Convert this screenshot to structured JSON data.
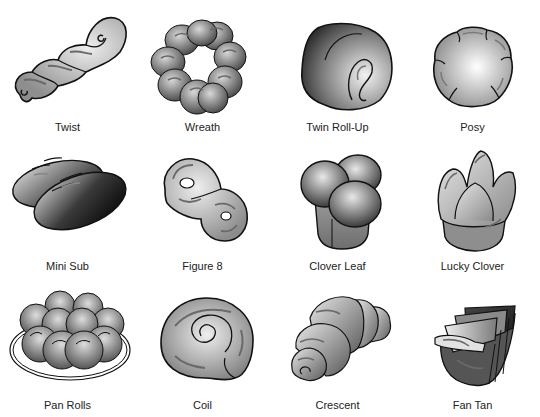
{
  "rolls": [
    {
      "label": "Twist"
    },
    {
      "label": "Wreath"
    },
    {
      "label": "Twin Roll-Up"
    },
    {
      "label": "Posy"
    },
    {
      "label": "Mini Sub"
    },
    {
      "label": "Figure 8"
    },
    {
      "label": "Clover Leaf"
    },
    {
      "label": "Lucky Clover"
    },
    {
      "label": "Pan Rolls"
    },
    {
      "label": "Coil"
    },
    {
      "label": "Crescent"
    },
    {
      "label": "Fan Tan"
    }
  ],
  "colors": {
    "outline": "#111111",
    "light": "#e6e6e6",
    "mid": "#9a9a9a",
    "dark": "#333333",
    "score": "#6a6a6a"
  }
}
